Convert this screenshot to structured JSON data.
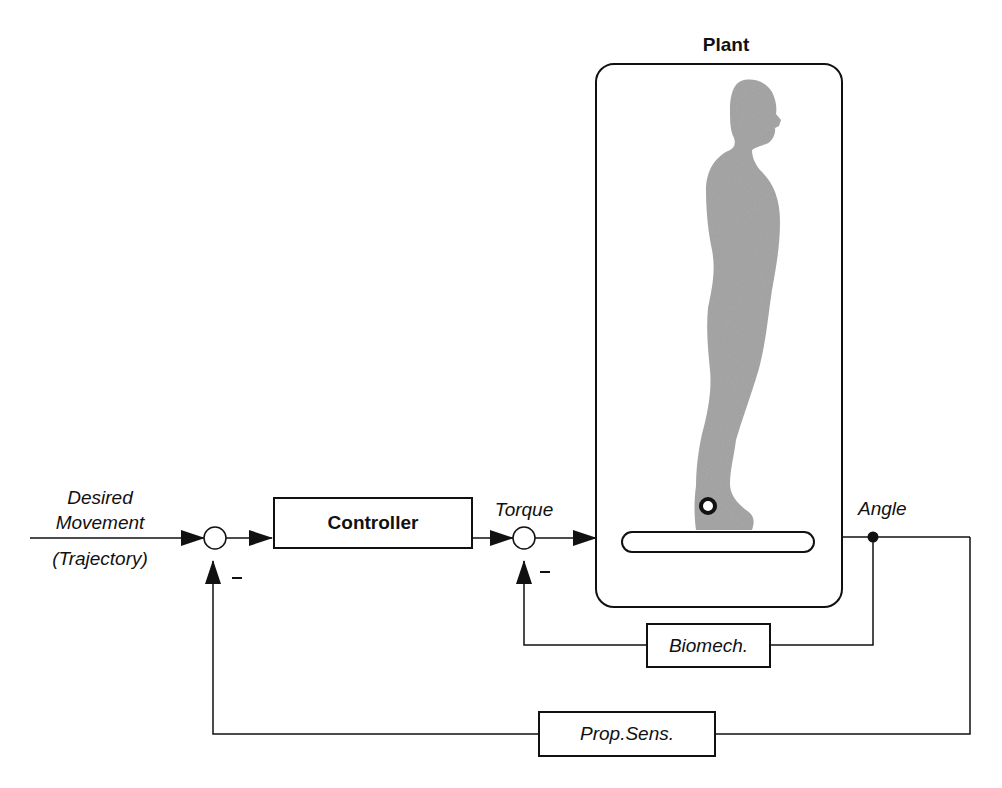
{
  "diagram": {
    "type": "control-loop-block-diagram",
    "plant": {
      "title": "Plant",
      "figure": "standing-human-silhouette",
      "joint": "ankle-joint",
      "support": "foot-platform"
    },
    "input": {
      "line1": "Desired",
      "line2": "Movement",
      "line3": "(Trajectory)"
    },
    "blocks": {
      "controller": "Controller",
      "biomech": "Biomech.",
      "prop_sens": "Prop.Sens."
    },
    "signals": {
      "torque": "Torque",
      "angle": "Angle"
    },
    "summing_junctions": [
      {
        "id": "outer",
        "feedback_sign": "–"
      },
      {
        "id": "inner",
        "feedback_sign": "–"
      }
    ],
    "colors": {
      "line": "#111111",
      "silhouette": "#a8a8a8",
      "background": "#ffffff"
    }
  }
}
